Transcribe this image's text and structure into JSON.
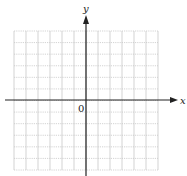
{
  "diagram": {
    "type": "coordinate-grid",
    "x_axis_label": "x",
    "y_axis_label": "y",
    "origin_label": "0",
    "grid": {
      "columns": 12,
      "rows": 12
    },
    "colors": {
      "grid": "#c8c8c8",
      "axis": "#222222",
      "background": "#ffffff"
    }
  }
}
